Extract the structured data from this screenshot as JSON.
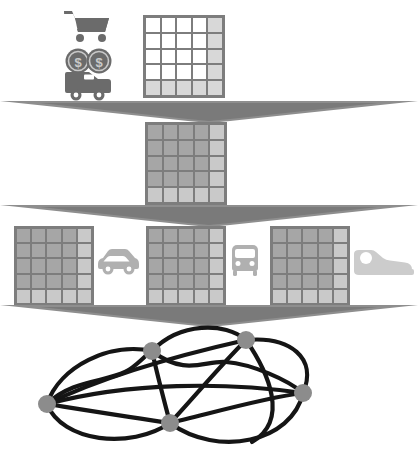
{
  "diagram": {
    "type": "layered-network-diagram",
    "background_color": "#ffffff",
    "layer_count": 4,
    "separator_color": "#8e8e8e",
    "separator_dark_color": "#6f6f6f"
  },
  "palette": {
    "grid_border": "#7d7d7d",
    "grid_cell_white": "#ffffff",
    "grid_cell_light": "#d8d8d8",
    "grid_cell_mid": "#a6a6a6",
    "grid_cell_midlight": "#c2c2c2",
    "icon_dark": "#6b6b6b",
    "icon_mid": "#9a9a9a",
    "icon_light": "#c9c9c9",
    "node_fill": "#8c8c8c",
    "edge_color": "#151515"
  },
  "layers": [
    {
      "index": 0,
      "name": "demand-layer",
      "label": "Demand / trip generation",
      "icons": [
        {
          "name": "shopping-cart-icon",
          "label": "Shopping cart",
          "glyph": "cart",
          "color": "#6b6b6b"
        },
        {
          "name": "money-coins-icon",
          "label": "Dollar coins",
          "glyph": "coins",
          "symbol": "$",
          "count": 2,
          "color": "#6b6b6b"
        },
        {
          "name": "delivery-van-icon",
          "label": "Delivery van",
          "glyph": "van",
          "color": "#6b6b6b"
        }
      ],
      "grids": [
        {
          "name": "zone-grid-demand",
          "label": "Zone matrix",
          "rows": 5,
          "cols": 5,
          "base_fill": "#ffffff",
          "highlight_fill": "#d8d8d8",
          "highlight_last_column": true,
          "highlight_last_row": true
        }
      ]
    },
    {
      "index": 1,
      "name": "distribution-layer",
      "label": "Trip distribution",
      "icons": [],
      "grids": [
        {
          "name": "zone-grid-distribution",
          "label": "Origin-destination matrix",
          "rows": 5,
          "cols": 5,
          "base_fill": "#a6a6a6",
          "highlight_fill": "#c9c9c9",
          "highlight_last_column": true,
          "highlight_last_row": true
        }
      ]
    },
    {
      "index": 2,
      "name": "mode-choice-layer",
      "label": "Mode choice",
      "icons": [
        {
          "name": "car-icon",
          "label": "Car",
          "glyph": "car",
          "color": "#b0b0b0"
        },
        {
          "name": "bus-icon",
          "label": "Bus",
          "glyph": "bus",
          "color": "#b0b0b0"
        },
        {
          "name": "walking-shoe-icon",
          "label": "Walking shoe",
          "glyph": "shoe",
          "color": "#cccccc"
        }
      ],
      "grids": [
        {
          "name": "zone-grid-car",
          "label": "Car mode matrix",
          "rows": 5,
          "cols": 5,
          "base_fill": "#a6a6a6",
          "highlight_fill": "#c9c9c9",
          "highlight_last_column": true,
          "highlight_last_row": true
        },
        {
          "name": "zone-grid-transit",
          "label": "Transit mode matrix",
          "rows": 5,
          "cols": 5,
          "base_fill": "#a6a6a6",
          "highlight_fill": "#c9c9c9",
          "highlight_last_column": true,
          "highlight_last_row": true
        },
        {
          "name": "zone-grid-walk",
          "label": "Walk mode matrix",
          "rows": 5,
          "cols": 5,
          "base_fill": "#a6a6a6",
          "highlight_fill": "#c9c9c9",
          "highlight_last_column": true,
          "highlight_last_row": true
        }
      ]
    },
    {
      "index": 3,
      "name": "assignment-layer",
      "label": "Network assignment",
      "icons": [],
      "grids": []
    }
  ],
  "network": {
    "name": "road-network-graph",
    "label": "Assignment network",
    "node_radius": 9,
    "node_fill": "#8c8c8c",
    "edge_color": "#151515",
    "edge_width": 4,
    "nodes": [
      {
        "id": "n1",
        "label": "West hub",
        "x": 47,
        "y": 404
      },
      {
        "id": "n2",
        "label": "North-west hub",
        "x": 152,
        "y": 351
      },
      {
        "id": "n3",
        "label": "North-east hub",
        "x": 246,
        "y": 340
      },
      {
        "id": "n4",
        "label": "East hub",
        "x": 303,
        "y": 393
      },
      {
        "id": "n5",
        "label": "South-central hub",
        "x": 170,
        "y": 423
      }
    ],
    "edges": [
      {
        "from": "n1",
        "to": "n2",
        "curve": "up"
      },
      {
        "from": "n1",
        "to": "n2",
        "curve": "wavy"
      },
      {
        "from": "n1",
        "to": "n3",
        "curve": "slight-up"
      },
      {
        "from": "n1",
        "to": "n4",
        "curve": "straight"
      },
      {
        "from": "n1",
        "to": "n5",
        "curve": "down"
      },
      {
        "from": "n1",
        "to": "n5",
        "curve": "deep-down"
      },
      {
        "from": "n2",
        "to": "n3",
        "curve": "arc-up"
      },
      {
        "from": "n2",
        "to": "n4",
        "curve": "wavy"
      },
      {
        "from": "n2",
        "to": "n5",
        "curve": "straight"
      },
      {
        "from": "n3",
        "to": "n4",
        "curve": "arc-right"
      },
      {
        "from": "n3",
        "to": "n5",
        "curve": "straight"
      },
      {
        "from": "n4",
        "to": "n5",
        "curve": "up"
      },
      {
        "from": "n4",
        "to": "n5",
        "curve": "down"
      },
      {
        "from": "n3",
        "to": "n1",
        "curve": "long-arc"
      }
    ]
  }
}
